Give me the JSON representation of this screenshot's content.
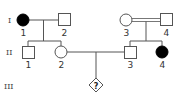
{
  "pedigree": {
    "generations": [
      "I",
      "II",
      "III"
    ],
    "individuals": [
      {
        "id": "I-1",
        "label": "1",
        "generation": "I",
        "sex": "female",
        "affected": true
      },
      {
        "id": "I-2",
        "label": "2",
        "generation": "I",
        "sex": "male",
        "affected": false
      },
      {
        "id": "I-3",
        "label": "3",
        "generation": "I",
        "sex": "female",
        "affected": false
      },
      {
        "id": "I-4",
        "label": "4",
        "generation": "I",
        "sex": "male",
        "affected": false
      },
      {
        "id": "II-1",
        "label": "1",
        "generation": "II",
        "sex": "male",
        "affected": false
      },
      {
        "id": "II-2",
        "label": "2",
        "generation": "II",
        "sex": "female",
        "affected": false
      },
      {
        "id": "II-3",
        "label": "3",
        "generation": "II",
        "sex": "male",
        "affected": false
      },
      {
        "id": "II-4",
        "label": "4",
        "generation": "II",
        "sex": "female",
        "affected": true
      },
      {
        "id": "III-?",
        "label": "?",
        "generation": "III",
        "sex": "unknown",
        "affected": null
      }
    ],
    "unions": [
      {
        "partners": [
          "I-1",
          "I-2"
        ],
        "consanguineous": false,
        "children": [
          "II-1",
          "II-2"
        ]
      },
      {
        "partners": [
          "I-3",
          "I-4"
        ],
        "consanguineous": true,
        "children": [
          "II-3",
          "II-4"
        ]
      },
      {
        "partners": [
          "II-2",
          "II-3"
        ],
        "consanguineous": false,
        "children": [
          "III-?"
        ]
      }
    ],
    "colors": {
      "line": "#555555",
      "affected": "#000000",
      "unaffected": "#ffffff"
    }
  }
}
